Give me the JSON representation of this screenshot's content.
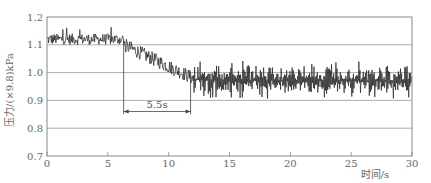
{
  "chart_data": {
    "type": "line",
    "title": "",
    "xlabel": "时间/s",
    "ylabel": "压力/(×9.8)kPa",
    "xlim": [
      0,
      30
    ],
    "ylim": [
      0.7,
      1.2
    ],
    "x_ticks": [
      0,
      5,
      10,
      15,
      20,
      25,
      30
    ],
    "x_tick_labels": [
      "0",
      "5",
      "10",
      "15",
      "20",
      "25",
      "30"
    ],
    "y_ticks": [
      0.7,
      0.8,
      0.9,
      1.0,
      1.1,
      1.2
    ],
    "y_tick_labels": [
      "0.7",
      "0.8",
      "0.9",
      "1.0",
      "1.1",
      "1.2"
    ],
    "grid": {
      "horizontal": true,
      "vertical": false
    },
    "legend": null,
    "series": [
      {
        "name": "pressure",
        "color": "#222222",
        "description": "Noisy pressure signal: plateau ~1.12 from 0-6.3 s, decay to ~0.98 by ~12 s, then oscillation around ~0.97 (±0.05) to 30 s",
        "segments": [
          {
            "t_start": 0.0,
            "t_end": 6.3,
            "mean_start": 1.12,
            "mean_end": 1.12,
            "noise_amplitude": 0.02,
            "spike_max": 1.17
          },
          {
            "t_start": 6.3,
            "t_end": 12.0,
            "mean_start": 1.1,
            "mean_end": 0.98,
            "noise_amplitude": 0.025
          },
          {
            "t_start": 12.0,
            "t_end": 30.0,
            "mean_start": 0.975,
            "mean_end": 0.97,
            "noise_amplitude": 0.055
          }
        ],
        "key_points": [
          {
            "x": 0,
            "y": 1.12
          },
          {
            "x": 3,
            "y": 1.12
          },
          {
            "x": 6.3,
            "y": 1.11
          },
          {
            "x": 8,
            "y": 1.05
          },
          {
            "x": 10,
            "y": 1.0
          },
          {
            "x": 12,
            "y": 0.98
          },
          {
            "x": 15,
            "y": 0.98
          },
          {
            "x": 20,
            "y": 0.97
          },
          {
            "x": 25,
            "y": 0.97
          },
          {
            "x": 30,
            "y": 0.96
          }
        ]
      }
    ],
    "annotations": [
      {
        "type": "vline",
        "x": 6.3,
        "y_from": 0.85,
        "y_to": 1.12
      },
      {
        "type": "vline",
        "x": 11.8,
        "y_from": 0.85,
        "y_to": 1.0
      },
      {
        "type": "double-arrow",
        "x_from": 6.3,
        "x_to": 11.8,
        "y": 0.86,
        "label": "5.5s"
      }
    ]
  },
  "labels": {
    "ylabel": "压力/(×9.8)kPa",
    "xlabel": "时间/s",
    "duration_annotation": "5.5s"
  }
}
